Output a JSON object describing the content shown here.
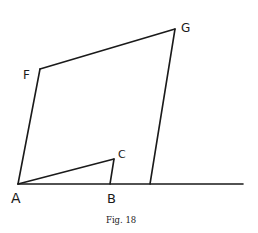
{
  "figure": {
    "caption": "Fig. 18",
    "points": {
      "A": "A",
      "B": "B",
      "C": "C",
      "F": "F",
      "G": "G"
    }
  }
}
